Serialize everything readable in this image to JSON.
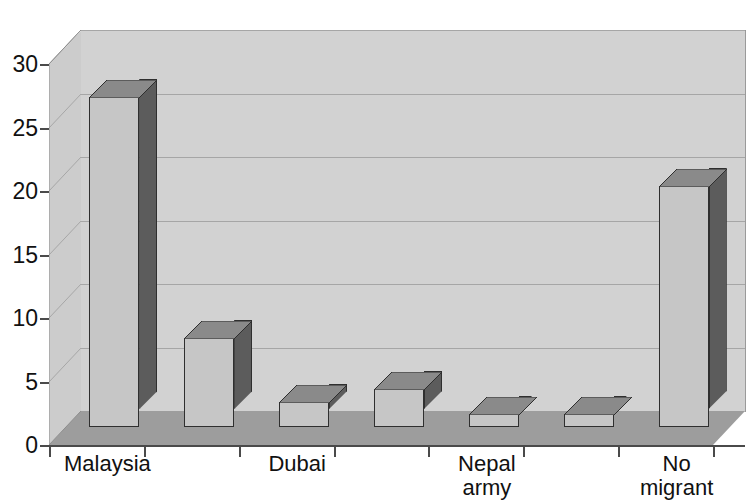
{
  "chart": {
    "title_partial": "",
    "type": "3d-column"
  },
  "y_axis": {
    "ticks": [
      "0",
      "5",
      "10",
      "15",
      "20",
      "25",
      "30"
    ]
  },
  "x_axis": {
    "labels": [
      {
        "line1": "Malaysia",
        "line2": ""
      },
      {
        "line1": "",
        "line2": ""
      },
      {
        "line1": "Dubai",
        "line2": ""
      },
      {
        "line1": "",
        "line2": ""
      },
      {
        "line1": "Nepal",
        "line2": "army"
      },
      {
        "line1": "",
        "line2": ""
      },
      {
        "line1": "No",
        "line2": "migrant"
      }
    ]
  },
  "colors": {
    "bar_front": "#c6c6c6",
    "bar_side": "#5c5c5c",
    "bar_top": "#8a8a8a",
    "back_wall": "#d2d2d2",
    "left_wall": "#cccccc",
    "floor": "#9d9d9d",
    "gridline": "#a6a6a6",
    "axis": "#4a4a4a",
    "text": "#111111"
  },
  "chart_data": {
    "type": "bar",
    "title": "",
    "xlabel": "",
    "ylabel": "",
    "ylim": [
      0,
      30
    ],
    "yticks": [
      0,
      5,
      10,
      15,
      20,
      25,
      30
    ],
    "grid": true,
    "legend": "none",
    "style": "3d-column grayscale",
    "categories": [
      "Malaysia",
      "",
      "Dubai",
      "",
      "Nepal army",
      "",
      "No migrant"
    ],
    "values": [
      26,
      7,
      2,
      3,
      1,
      1,
      19
    ]
  }
}
